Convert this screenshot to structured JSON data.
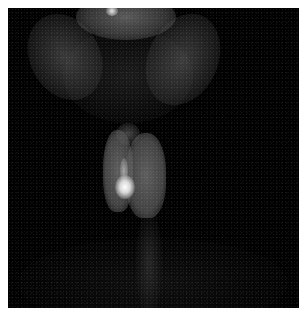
{
  "image": {
    "description": "Grayscale nuclear medicine scintigraphy of the neck showing thyroid uptake with a focal hot nodule in the lower left lobe",
    "background_color": "#000000",
    "border_color": "#ffffff",
    "regions": [
      {
        "name": "upper-head-activity",
        "color": "#787878"
      },
      {
        "name": "thyroid-gland",
        "color": "#6e6e6e"
      },
      {
        "name": "hot-nodule",
        "color": "#ffffff"
      },
      {
        "name": "neck-background",
        "color": "#303030"
      }
    ]
  }
}
